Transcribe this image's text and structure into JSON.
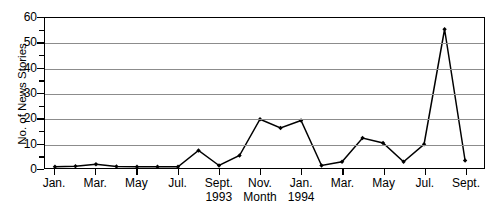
{
  "figure": {
    "cut_title": "Coverage in the News Media",
    "background_color": "#ffffff",
    "line_color": "#000000",
    "grid_color": "#8c8c8c",
    "axis_color": "#000000"
  },
  "chart_data": {
    "type": "line",
    "title": "",
    "xlabel": "Month",
    "ylabel": "No. of News Stories",
    "ylim": [
      0,
      60
    ],
    "ytick_labels": [
      "0",
      "10",
      "20",
      "30",
      "40",
      "50",
      "60"
    ],
    "ytick_values": [
      0,
      10,
      20,
      30,
      40,
      50,
      60
    ],
    "yminor_values": [
      5,
      15,
      25,
      35,
      45,
      55
    ],
    "grid": true,
    "grid_axis": "y",
    "legend": "none",
    "marker": "filled-diamond",
    "x_tick_labels": [
      "Jan.",
      "Mar.",
      "May",
      "Jul.",
      "Sept.",
      "Nov.",
      "Jan.",
      "Mar.",
      "May",
      "Jul.",
      "Sept."
    ],
    "x_year_labels": [
      {
        "text": "1993",
        "at_category": "Sept."
      },
      {
        "text": "1994",
        "at_category": "Jan."
      }
    ],
    "categories": [
      "Jan. 1993",
      "Feb. 1993",
      "Mar. 1993",
      "Apr. 1993",
      "May 1993",
      "Jun. 1993",
      "Jul. 1993",
      "Aug. 1993",
      "Sept. 1993",
      "Oct. 1993",
      "Nov. 1993",
      "Dec. 1993",
      "Jan. 1994",
      "Feb. 1994",
      "Mar. 1994",
      "Apr. 1994",
      "May 1994",
      "Jun. 1994",
      "Jul. 1994",
      "Aug. 1994",
      "Sept. 1994"
    ],
    "values": [
      0.5,
      0.7,
      1.5,
      0.6,
      0.5,
      0.5,
      0.5,
      7.0,
      1.0,
      5.0,
      19.5,
      16.0,
      19.0,
      1.0,
      2.5,
      12.0,
      10.0,
      2.5,
      9.5,
      55.5,
      3.0
    ]
  }
}
